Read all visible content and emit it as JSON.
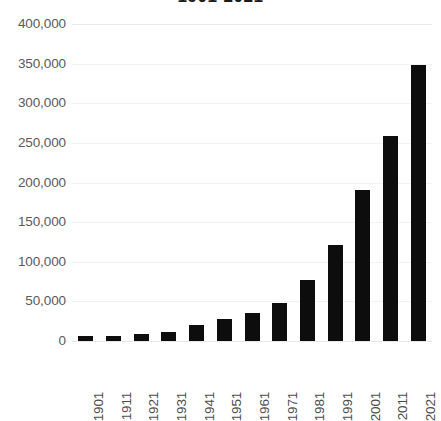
{
  "chart_data": {
    "type": "bar",
    "title": "1901-2021",
    "xlabel": "",
    "ylabel": "",
    "categories": [
      "1901",
      "1911",
      "1921",
      "1931",
      "1941",
      "1951",
      "1961",
      "1971",
      "1981",
      "1991",
      "2001",
      "2011",
      "2021"
    ],
    "values": [
      6300,
      6600,
      8500,
      11000,
      20000,
      27500,
      35500,
      48000,
      77000,
      121000,
      191000,
      258500,
      348000
    ],
    "ylim": [
      0,
      400000
    ],
    "y_ticks": [
      0,
      50000,
      100000,
      150000,
      200000,
      250000,
      300000,
      350000,
      400000
    ],
    "y_tick_labels": [
      "0",
      "50,000",
      "100,000",
      "150,000",
      "200,000",
      "250,000",
      "300,000",
      "350,000",
      "400,000"
    ],
    "grid": true,
    "grid_axis": "y",
    "legend": false,
    "legend_position": "none",
    "bar_color": "#0d0d0d",
    "gridline_color": "#f2f2f2",
    "axis_label_color": "#5a5a5a",
    "background_color": "#ffffff",
    "x_tick_rotation": 90
  }
}
